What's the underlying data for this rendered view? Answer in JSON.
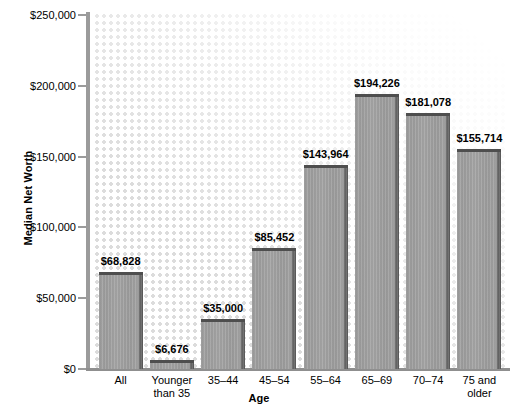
{
  "chart_data": {
    "type": "bar",
    "title": "",
    "xlabel": "Age",
    "ylabel": "Median Net Worth",
    "categories": [
      "All",
      "Younger than 35",
      "35–44",
      "45–54",
      "55–64",
      "65–69",
      "70–74",
      "75 and older"
    ],
    "category_lines": [
      [
        "All"
      ],
      [
        "Younger",
        "than 35"
      ],
      [
        "35–44"
      ],
      [
        "45–54"
      ],
      [
        "55–64"
      ],
      [
        "65–69"
      ],
      [
        "70–74"
      ],
      [
        "75 and",
        "older"
      ]
    ],
    "values": [
      68828,
      6676,
      35000,
      85452,
      143964,
      194226,
      181078,
      155714
    ],
    "value_labels": [
      "$68,828",
      "$6,676",
      "$35,000",
      "$85,452",
      "$143,964",
      "$194,226",
      "$181,078",
      "$155,714"
    ],
    "ylim": [
      0,
      250000
    ],
    "ytick_values": [
      0,
      50000,
      100000,
      150000,
      200000,
      250000
    ],
    "ytick_labels": [
      "$0",
      "$50,000",
      "$100,000",
      "$150,000",
      "$200,000",
      "$250,000"
    ],
    "grid": false,
    "legend": "none",
    "bar_color": "#9e9e9e",
    "bar_edge_color": "#4e4e4e",
    "axis_color": "#9b9b9b",
    "plot_background": "#ffffff",
    "dot_pattern_color": "#dcdcdc"
  }
}
